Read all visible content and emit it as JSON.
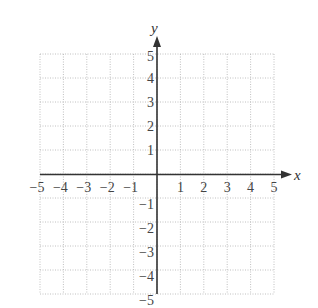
{
  "chart_data": {
    "type": "scatter",
    "title": "",
    "xlabel": "x",
    "ylabel": "y",
    "xlim": [
      -5,
      5
    ],
    "ylim": [
      -5,
      5
    ],
    "grid": true,
    "grid_style": "dotted",
    "x_ticks": [
      "-5",
      "-4",
      "-3",
      "-2",
      "-1",
      "1",
      "2",
      "3",
      "4",
      "5"
    ],
    "y_ticks": [
      "5",
      "4",
      "3",
      "2",
      "1",
      "-1",
      "-2",
      "-3",
      "-4",
      "-5"
    ],
    "series": [],
    "legend": null
  },
  "axes": {
    "x_label": "x",
    "y_label": "y",
    "x_tick_labels": [
      "−5",
      "−4",
      "−3",
      "−2",
      "−1",
      "1",
      "2",
      "3",
      "4",
      "5"
    ],
    "y_tick_labels": [
      "5",
      "4",
      "3",
      "2",
      "1",
      "−1",
      "−2",
      "−3",
      "−4",
      "−5"
    ]
  },
  "colors": {
    "axis": "#333333",
    "grid": "#b0b0b0",
    "text": "#444444"
  }
}
